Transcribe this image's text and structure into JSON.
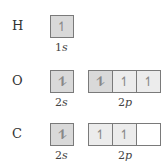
{
  "rows": [
    {
      "element": "H",
      "subshells": [
        {
          "label_n": "1",
          "label_l": "s",
          "orbitals": [
            "↿"
          ]
        }
      ]
    },
    {
      "element": "O",
      "subshells": [
        {
          "label_n": "2",
          "label_l": "s",
          "orbitals": [
            "⥮"
          ]
        },
        {
          "label_n": "2",
          "label_l": "p",
          "orbitals": [
            "⥮",
            "↿",
            "↿"
          ]
        }
      ]
    },
    {
      "element": "C",
      "subshells": [
        {
          "label_n": "2",
          "label_l": "s",
          "orbitals": [
            "⥮"
          ]
        },
        {
          "label_n": "2",
          "label_l": "p",
          "orbitals": [
            "↿",
            "↿",
            ""
          ]
        }
      ]
    }
  ]
}
